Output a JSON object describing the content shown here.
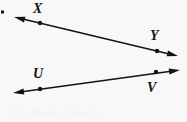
{
  "figure": {
    "kind": "geometry-diagram",
    "width": 187,
    "height": 122,
    "background_color": "#f8f8f8",
    "ink_color": "#141414"
  },
  "labels": {
    "x": "X",
    "y": "Y",
    "u": "U",
    "v": "V"
  },
  "artifacts": {
    "edge_speck": "·",
    "ghost_text": "scan bleed-through"
  },
  "chart_data": {
    "type": "scatter",
    "title": "",
    "xlabel": "",
    "ylabel": "",
    "xlim": [
      0,
      187
    ],
    "ylim": [
      0,
      122
    ],
    "grid": false,
    "legend": "none",
    "lines": [
      {
        "name": "line-XY",
        "style": "double-headed-arrow",
        "x": [
          14,
          178
        ],
        "y": [
          17,
          56
        ],
        "points": [
          {
            "label": "X",
            "x": 40,
            "y": 23,
            "label_position": "above"
          },
          {
            "label": "Y",
            "x": 157,
            "y": 51,
            "label_position": "above"
          }
        ]
      },
      {
        "name": "line-UV",
        "style": "double-headed-arrow",
        "x": [
          13,
          180
        ],
        "y": [
          93,
          70
        ],
        "points": [
          {
            "label": "U",
            "x": 40,
            "y": 89,
            "label_position": "above"
          },
          {
            "label": "V",
            "x": 156,
            "y": 72,
            "label_position": "below"
          }
        ]
      }
    ]
  }
}
